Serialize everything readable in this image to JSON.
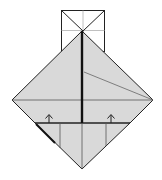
{
  "diagram": {
    "type": "origami-fold-step",
    "colors": {
      "background": "#ffffff",
      "paper_fill": "#d9d9d9",
      "line": "#222222",
      "thin_line": "#555555",
      "crease": "#b0b0b0"
    },
    "elements": {
      "top_square": "square-with-diagonals",
      "diamond_body": "folded-diamond",
      "arrows": [
        "fold-up-arrow-left",
        "fold-up-arrow-right"
      ]
    }
  }
}
